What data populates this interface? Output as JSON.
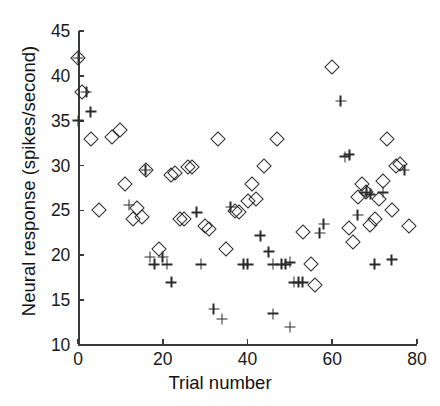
{
  "chart_data": {
    "type": "scatter",
    "title": "",
    "xlabel": "Trial number",
    "ylabel": "Neural response (spikes/second)",
    "xlim": [
      0,
      80
    ],
    "ylim": [
      10,
      45
    ],
    "xticks": [
      0,
      20,
      40,
      60,
      80
    ],
    "yticks": [
      10,
      15,
      20,
      25,
      30,
      35,
      40,
      45
    ],
    "xtick_labels": [
      "0",
      "20",
      "40",
      "60",
      "80"
    ],
    "ytick_labels": [
      "10",
      "15",
      "20",
      "25",
      "30",
      "35",
      "40",
      "45"
    ],
    "grid": false,
    "legend": null,
    "series": [
      {
        "name": "diamond",
        "marker": "diamond-open",
        "points": [
          [
            0,
            42.0
          ],
          [
            1,
            38.2
          ],
          [
            3,
            33.0
          ],
          [
            5,
            25.0
          ],
          [
            8,
            33.2
          ],
          [
            10,
            34.0
          ],
          [
            11,
            28.0
          ],
          [
            13,
            24.0
          ],
          [
            14,
            25.3
          ],
          [
            15,
            24.3
          ],
          [
            16,
            29.5
          ],
          [
            19,
            20.7
          ],
          [
            22,
            29.0
          ],
          [
            23,
            29.2
          ],
          [
            24,
            24.0
          ],
          [
            25,
            24.0
          ],
          [
            26,
            29.8
          ],
          [
            27,
            29.8
          ],
          [
            30,
            23.3
          ],
          [
            31,
            22.9
          ],
          [
            33,
            33.0
          ],
          [
            35,
            20.7
          ],
          [
            37,
            24.9
          ],
          [
            38,
            24.8
          ],
          [
            40,
            26.0
          ],
          [
            41,
            28.0
          ],
          [
            42,
            26.3
          ],
          [
            44,
            30.0
          ],
          [
            47,
            33.0
          ],
          [
            53,
            22.6
          ],
          [
            55,
            19.0
          ],
          [
            56,
            16.7
          ],
          [
            60,
            41.0
          ],
          [
            64,
            23.0
          ],
          [
            65,
            21.5
          ],
          [
            66,
            26.5
          ],
          [
            67,
            28.0
          ],
          [
            68,
            27.0
          ],
          [
            69,
            23.4
          ],
          [
            70,
            24.0
          ],
          [
            71,
            26.3
          ],
          [
            72,
            28.3
          ],
          [
            73,
            33.0
          ],
          [
            74,
            25.0
          ],
          [
            75,
            29.9
          ],
          [
            76,
            30.2
          ],
          [
            78,
            23.3
          ]
        ]
      },
      {
        "name": "plus",
        "marker": "plus",
        "points": [
          [
            0,
            35.0
          ],
          [
            0,
            42.0
          ],
          [
            2,
            38.2
          ],
          [
            3,
            36.0
          ],
          [
            12,
            25.6
          ],
          [
            16,
            29.5
          ],
          [
            17,
            19.8
          ],
          [
            18,
            19.0
          ],
          [
            20,
            19.8
          ],
          [
            21,
            19.0
          ],
          [
            22,
            17.0
          ],
          [
            28,
            24.8
          ],
          [
            29,
            19.0
          ],
          [
            32,
            14.0
          ],
          [
            34,
            12.9
          ],
          [
            36,
            25.4
          ],
          [
            39,
            19.0
          ],
          [
            40,
            19.0
          ],
          [
            43,
            22.2
          ],
          [
            45,
            20.4
          ],
          [
            46,
            19.0
          ],
          [
            48,
            19.0
          ],
          [
            49,
            19.0
          ],
          [
            50,
            19.2
          ],
          [
            51,
            17.0
          ],
          [
            52,
            17.0
          ],
          [
            53,
            17.0
          ],
          [
            46,
            13.5
          ],
          [
            50,
            12.0
          ],
          [
            57,
            22.5
          ],
          [
            58,
            23.5
          ],
          [
            62,
            37.2
          ],
          [
            63,
            31.0
          ],
          [
            64,
            31.2
          ],
          [
            66,
            24.5
          ],
          [
            68,
            27.0
          ],
          [
            69,
            26.8
          ],
          [
            70,
            19.0
          ],
          [
            72,
            27.0
          ],
          [
            74,
            19.5
          ],
          [
            77,
            29.5
          ]
        ]
      }
    ]
  }
}
